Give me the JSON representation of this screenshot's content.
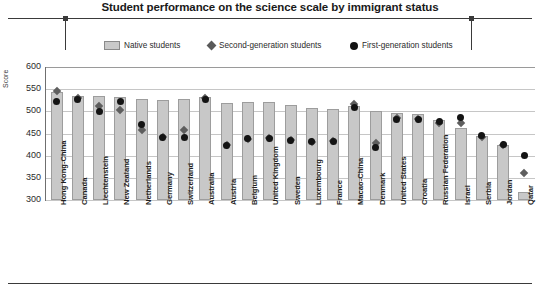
{
  "chart_data": {
    "type": "bar",
    "title": "Student performance on the science scale by immigrant status",
    "xlabel": "",
    "ylabel": "Score",
    "ylim": [
      300,
      600
    ],
    "yticks": [
      300,
      350,
      400,
      450,
      500,
      550,
      600
    ],
    "grid": true,
    "legend_position": "top",
    "categories": [
      "Hong Kong-China",
      "Canada",
      "Liechtenstein",
      "New Zealand",
      "Netherlands",
      "Germany",
      "Switzerland",
      "Australia",
      "Austria",
      "Belgium",
      "United Kingdom",
      "Sweden",
      "Luxembourg",
      "France",
      "Macao-China",
      "Denmark",
      "United States",
      "Croatia",
      "Russian Federation",
      "Israel",
      "Serbia",
      "Jordan",
      "Qatar"
    ],
    "series": [
      {
        "name": "Native students",
        "marker": "bar",
        "values": [
          543,
          535,
          535,
          533,
          528,
          526,
          528,
          532,
          519,
          520,
          521,
          514,
          508,
          506,
          512,
          500,
          496,
          494,
          481,
          462,
          444,
          424,
          318
        ]
      },
      {
        "name": "Second-generation students",
        "marker": "diamond",
        "values": [
          545,
          531,
          512,
          503,
          459,
          442,
          458,
          529,
          424,
          437,
          440,
          436,
          431,
          433,
          517,
          428,
          484,
          483,
          474,
          473,
          441,
          423,
          362
        ]
      },
      {
        "name": "First-generation students",
        "marker": "circle",
        "values": [
          522,
          527,
          500,
          522,
          470,
          441,
          440,
          526,
          424,
          438,
          439,
          435,
          433,
          432,
          508,
          418,
          481,
          482,
          478,
          487,
          446,
          425,
          400
        ]
      }
    ]
  },
  "legend": {
    "items": [
      {
        "label": "Native students",
        "icon": "bar-swatch"
      },
      {
        "label": "Second-generation students",
        "icon": "diamond-marker"
      },
      {
        "label": "First-generation students",
        "icon": "circle-marker"
      }
    ]
  },
  "colors": {
    "bar_fill": "#c8c8c8",
    "bar_stroke": "#9d9d9d",
    "diamond": "#5e5e5e",
    "circle": "#141414",
    "grid": "#c6c6c6",
    "axis": "#6f6f6f",
    "text": "#1f1f1f"
  }
}
